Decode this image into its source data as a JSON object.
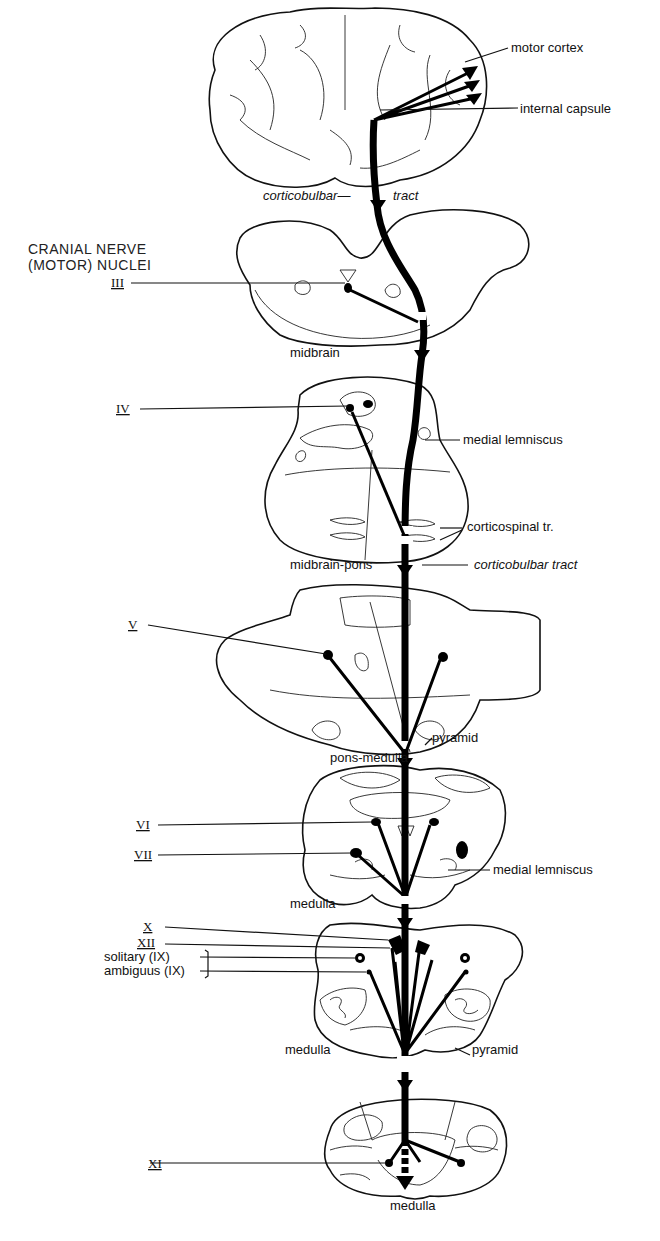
{
  "heading": {
    "line1": "CRANIAL  NERVE",
    "line2": "(MOTOR) NUCLEI"
  },
  "sections": [
    {
      "id": "cortex",
      "label": ""
    },
    {
      "id": "midbrain",
      "label": "midbrain"
    },
    {
      "id": "midbrain-pons",
      "label": "midbrain-pons"
    },
    {
      "id": "pons-medulla",
      "label": "pons-medulla"
    },
    {
      "id": "medulla-upper",
      "label": "medulla"
    },
    {
      "id": "medulla-middle",
      "label": "medulla"
    },
    {
      "id": "medulla-lower",
      "label": "medulla"
    }
  ],
  "structure_labels": {
    "motor_cortex": "motor cortex",
    "internal_capsule": "internal capsule",
    "corticobulbar_top_left": "corticobulbar—",
    "corticobulbar_top_right": "tract",
    "medial_lemniscus_1": "medial lemniscus",
    "corticospinal": "corticospinal tr.",
    "corticobulbar_mid": "corticobulbar tract",
    "pyramid_1": "pyramid",
    "medial_lemniscus_2": "medial lemniscus",
    "pyramid_2": "pyramid"
  },
  "nuclei": {
    "III": "III",
    "IV": "IV",
    "V": "V",
    "VI": "VI",
    "VII": "VII",
    "X": "X",
    "XII": "XII",
    "solitary": "solitary (IX)",
    "ambiguus": "ambiguus (IX)",
    "XI": "XI"
  },
  "colors": {
    "ink": "#000000",
    "background": "#ffffff"
  }
}
